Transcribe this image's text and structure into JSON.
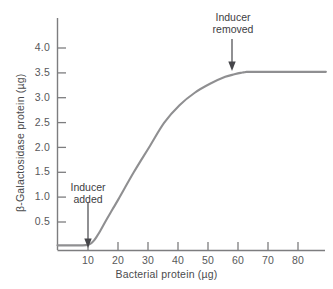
{
  "chart_data": {
    "type": "line",
    "title": "",
    "xlabel": "Bacterial protein (µg)",
    "ylabel": "β-Galactosidase protein (µg)",
    "xlim": [
      0,
      88
    ],
    "ylim": [
      0,
      4.3
    ],
    "xticks": [
      10,
      20,
      30,
      40,
      50,
      60,
      70,
      80
    ],
    "xtick_labels": [
      "10",
      "20",
      "30",
      "40",
      "50",
      "60",
      "70",
      "80"
    ],
    "yticks": [
      0.5,
      1.0,
      1.5,
      2.0,
      2.5,
      3.0,
      3.5,
      4.0
    ],
    "ytick_labels": [
      "0.5",
      "1.0",
      "1.5",
      "2.0",
      "2.5",
      "3.0",
      "3.5",
      "4.0"
    ],
    "grid": false,
    "legend": false,
    "series": [
      {
        "name": "β-Galactosidase protein",
        "color": "#8f8f91",
        "x": [
          0,
          2,
          4,
          6,
          8,
          10,
          11,
          12,
          13,
          14,
          16,
          18,
          20,
          25,
          30,
          35,
          40,
          45,
          50,
          55,
          58,
          60,
          61,
          62,
          63,
          64,
          65,
          68,
          72,
          76,
          80,
          84,
          88
        ],
        "y": [
          0.03,
          0.03,
          0.03,
          0.03,
          0.03,
          0.04,
          0.07,
          0.13,
          0.22,
          0.32,
          0.54,
          0.75,
          0.96,
          1.5,
          2.0,
          2.5,
          2.85,
          3.1,
          3.28,
          3.42,
          3.47,
          3.5,
          3.51,
          3.52,
          3.52,
          3.52,
          3.52,
          3.52,
          3.52,
          3.52,
          3.52,
          3.52,
          3.52
        ]
      }
    ],
    "annotations": [
      {
        "name": "inducer-added",
        "lines": [
          "Inducer",
          "added"
        ],
        "text": "Inducer added",
        "arrow_x": 10,
        "arrow_tip_y": 0.07,
        "arrow_tail_y": 0.95
      },
      {
        "name": "inducer-removed",
        "lines": [
          "Inducer",
          "removed"
        ],
        "text": "Inducer removed",
        "arrow_x": 63,
        "arrow_tip_y": 3.75,
        "arrow_tail_y": 4.3
      }
    ]
  },
  "colors": {
    "curve": "#8f8f91",
    "axis": "#7d7d7f",
    "tick_text": "#58585a",
    "label_text": "#4b4b4d",
    "annotation_text": "#3d3d3f",
    "background": "#ffffff"
  }
}
